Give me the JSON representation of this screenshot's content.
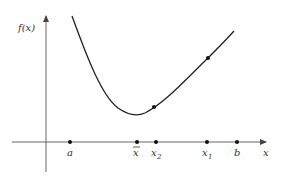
{
  "diagram": {
    "type": "function-plot",
    "y_axis_label": "f(x)",
    "x_axis_label": "x",
    "colors": {
      "axis": "#555555",
      "curve": "#222222",
      "points": "#111111",
      "background": "#ffffff"
    },
    "x_points": [
      {
        "id": "a",
        "label": "a",
        "sub": ""
      },
      {
        "id": "xbar",
        "label": "x",
        "sub": "",
        "overline": true
      },
      {
        "id": "x2",
        "label": "x",
        "sub": "2"
      },
      {
        "id": "x1",
        "label": "x",
        "sub": "1"
      },
      {
        "id": "b",
        "label": "b",
        "sub": ""
      }
    ],
    "curve_points": [
      {
        "id": "x2",
        "on_curve": true
      },
      {
        "id": "x1",
        "on_curve": true
      }
    ]
  }
}
